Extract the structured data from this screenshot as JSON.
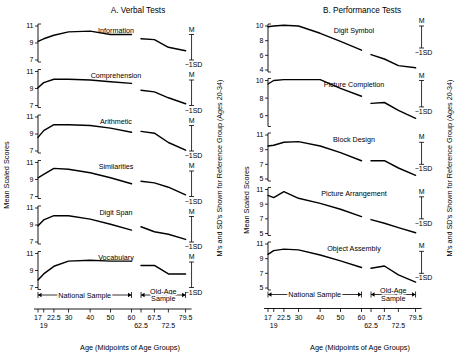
{
  "figure": {
    "y_axis_label": "Mean Scaled Scores",
    "x_axis_label": "Age (Midpoints of Age Groups)",
    "right_axis_label": "M's and SD's Shown for Reference Group (Ages 20-34)",
    "national_sample_label": "National Sample",
    "old_age_sample_label_line1": "Old-Age",
    "old_age_sample_label_line2": "Sample",
    "marker_mean": "M",
    "marker_sd": "−1SD",
    "x_ticks_upper": [
      "17",
      "22.5",
      "30",
      "40",
      "50",
      "60",
      "67.5",
      "79.5"
    ],
    "x_ticks_lower": [
      "19",
      "62.5",
      "72.5"
    ]
  },
  "chart_data": {
    "type": "line",
    "xlabel": "Age (Midpoints of Age Groups)",
    "ylabel": "Mean Scaled Scores",
    "grid": false,
    "legend": "none",
    "x": [
      17,
      19,
      22.5,
      30,
      40,
      50,
      60,
      62.5,
      67.5,
      72.5,
      79.5
    ],
    "x_national_sample": [
      17,
      19,
      22.5,
      30,
      40,
      50,
      60
    ],
    "x_old_age_sample": [
      62.5,
      67.5,
      72.5,
      79.5
    ],
    "reference_group": "Ages 20-34",
    "reference_mean": 10,
    "reference_minus_1sd": 7,
    "panels": [
      {
        "panel": "A",
        "panel_title": "A.  Verbal Tests",
        "subtests": [
          {
            "name": "Information",
            "ylim": [
              7,
              11
            ],
            "yticks": [
              11,
              9,
              7
            ],
            "national_sample": [
              9.2,
              9.5,
              9.9,
              10.3,
              10.4,
              10.0,
              10.0
            ],
            "old_age_sample": [
              9.5,
              9.4,
              8.5,
              8.1
            ]
          },
          {
            "name": "Comprehension",
            "ylim": [
              7,
              11
            ],
            "yticks": [
              11,
              9,
              7
            ],
            "national_sample": [
              9.1,
              9.7,
              10.1,
              10.1,
              10.0,
              9.8,
              9.6
            ],
            "old_age_sample": [
              8.8,
              8.6,
              7.9,
              7.2
            ]
          },
          {
            "name": "Arithmetic",
            "ylim": [
              7,
              11
            ],
            "yticks": [
              11,
              9,
              7
            ],
            "national_sample": [
              8.6,
              9.4,
              10.1,
              10.1,
              10.0,
              9.7,
              9.2
            ],
            "old_age_sample": [
              9.3,
              9.1,
              8.0,
              7.1
            ]
          },
          {
            "name": "Similarities",
            "ylim": [
              7,
              11
            ],
            "yticks": [
              11,
              9,
              7
            ],
            "national_sample": [
              9.2,
              9.6,
              10.3,
              10.2,
              9.8,
              9.2,
              8.5
            ],
            "old_age_sample": [
              8.8,
              8.6,
              8.1,
              7.2
            ]
          },
          {
            "name": "Digit Span",
            "ylim": [
              7,
              11
            ],
            "yticks": [
              11,
              9,
              7
            ],
            "national_sample": [
              8.9,
              9.6,
              10.1,
              10.1,
              9.7,
              9.1,
              8.4
            ],
            "old_age_sample": [
              8.8,
              8.2,
              7.9,
              7.3
            ]
          },
          {
            "name": "Vocabulary",
            "ylim": [
              7,
              11
            ],
            "yticks": [
              11,
              9,
              7
            ],
            "national_sample": [
              7.9,
              8.6,
              9.5,
              10.1,
              10.2,
              10.1,
              10.1
            ],
            "old_age_sample": [
              9.6,
              9.6,
              8.6,
              8.6
            ]
          }
        ]
      },
      {
        "panel": "B",
        "panel_title": "B.  Performance Tests",
        "subtests": [
          {
            "name": "Digit Symbol",
            "ylim": [
              4,
              10
            ],
            "yticks": [
              10,
              8,
              6,
              4
            ],
            "national_sample": [
              9.9,
              10.0,
              10.1,
              10.0,
              9.0,
              7.9,
              6.7
            ],
            "old_age_sample": [
              6.1,
              5.5,
              4.6,
              4.3
            ]
          },
          {
            "name": "Picture Completion",
            "ylim": [
              5,
              10
            ],
            "yticks": [
              10,
              8,
              6
            ],
            "national_sample": [
              9.6,
              10.0,
              10.1,
              10.1,
              10.1,
              9.1,
              8.2
            ],
            "old_age_sample": [
              7.4,
              7.5,
              6.6,
              5.7
            ]
          },
          {
            "name": "Block Design",
            "ylim": [
              5,
              11
            ],
            "yticks": [
              11,
              9,
              7,
              5
            ],
            "national_sample": [
              9.5,
              9.6,
              10.0,
              10.1,
              9.5,
              8.6,
              7.5
            ],
            "old_age_sample": [
              7.5,
              7.5,
              6.5,
              5.5
            ]
          },
          {
            "name": "Picture Arrangement",
            "ylim": [
              5,
              11
            ],
            "yticks": [
              11,
              9,
              7,
              5
            ],
            "national_sample": [
              10.2,
              9.9,
              10.7,
              9.8,
              9.1,
              8.3,
              7.3
            ],
            "old_age_sample": [
              6.9,
              6.4,
              5.8,
              5.1
            ]
          },
          {
            "name": "Object Assembly",
            "ylim": [
              5,
              11
            ],
            "yticks": [
              11,
              9,
              7,
              5
            ],
            "national_sample": [
              9.6,
              10.1,
              10.3,
              10.2,
              9.5,
              8.7,
              7.8
            ],
            "old_age_sample": [
              7.7,
              8.0,
              6.8,
              5.8
            ]
          }
        ]
      }
    ]
  }
}
